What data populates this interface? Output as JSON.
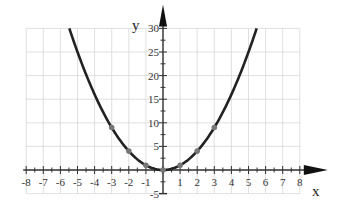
{
  "chart_data": {
    "type": "line",
    "title": "",
    "function": "y = x^2",
    "xlabel": "x",
    "ylabel": "y",
    "xlim": [
      -8,
      8
    ],
    "ylim": [
      -5,
      30
    ],
    "grid": true,
    "x_ticks": [
      -8,
      -7,
      -6,
      -5,
      -4,
      -3,
      -2,
      -1,
      1,
      2,
      3,
      4,
      5,
      6,
      7,
      8
    ],
    "y_ticks": [
      30,
      25,
      20,
      15,
      10,
      5,
      -5
    ],
    "marked_points": [
      {
        "x": -3,
        "y": 9
      },
      {
        "x": -2,
        "y": 4
      },
      {
        "x": -1,
        "y": 1
      },
      {
        "x": 0,
        "y": 0
      },
      {
        "x": 1,
        "y": 1
      },
      {
        "x": 2,
        "y": 4
      },
      {
        "x": 3,
        "y": 9
      }
    ],
    "curve_color": "#222222",
    "point_color": "#777777",
    "grid_color": "#d8d8d8"
  },
  "labels": {
    "x": "x",
    "y": "y"
  }
}
